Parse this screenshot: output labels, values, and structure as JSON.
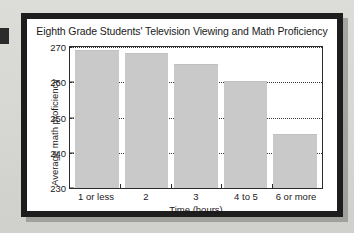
{
  "figure": {
    "background_color": "#d9d9d6",
    "frame_color": "#1d1d1d",
    "card_color": "#ffffff"
  },
  "chart_data": {
    "type": "bar",
    "title": "Eighth Grade Students' Television Viewing and Math Proficiency",
    "xlabel": "Time (hours)",
    "ylabel": "Average math proficiency",
    "categories": [
      "1 or less",
      "2",
      "3",
      "4 to 5",
      "6 or more"
    ],
    "values": [
      269,
      268,
      265,
      260,
      245
    ],
    "ylim": [
      230,
      270
    ],
    "yticks": [
      230,
      240,
      250,
      260,
      270
    ],
    "ytick_labels": [
      "230",
      "240",
      "250",
      "260",
      "270"
    ],
    "grid": true,
    "grid_style": "dotted",
    "legend": null,
    "bar_color": "#c9c9c9",
    "axis_color": "#2a2a2a"
  }
}
